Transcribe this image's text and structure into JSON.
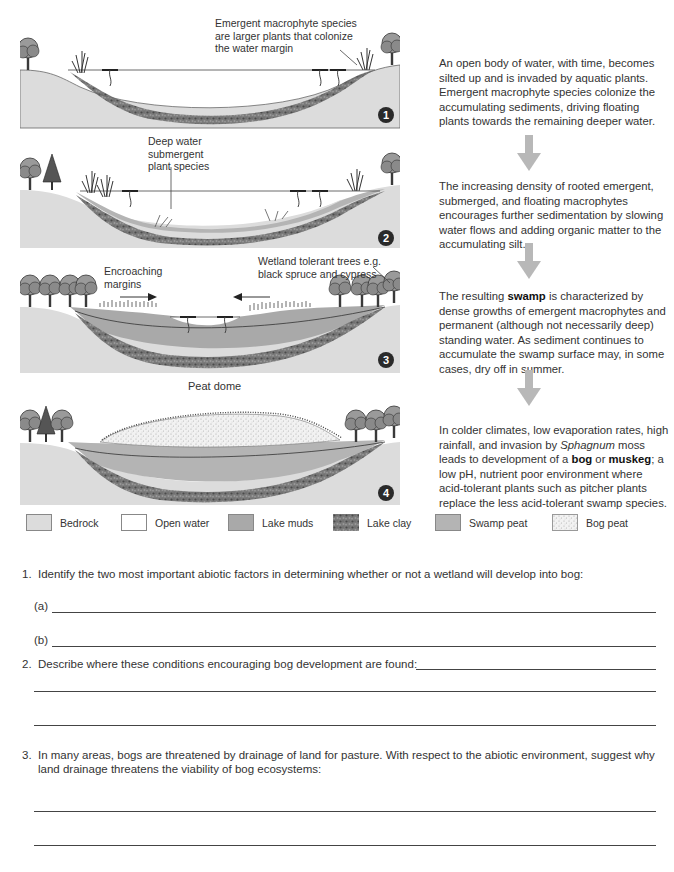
{
  "colors": {
    "bedrock": "#dcdcdc",
    "open_water": "#ffffff",
    "lake_muds": "#a9a9a9",
    "lake_clay": "#6e6e6e",
    "swamp_peat": "#b4b4b4",
    "bog_peat": "#ececec",
    "arrow": "#b8b8b8",
    "badge": "#2a2a2a"
  },
  "panels": [
    {
      "number": "1",
      "callouts": [
        "Emergent macrophyte species are larger plants that colonize the water margin"
      ]
    },
    {
      "number": "2",
      "callouts": [
        "Deep water submergent plant species"
      ]
    },
    {
      "number": "3",
      "callouts": [
        "Encroaching margins",
        "Wetland tolerant trees e.g. black spruce and cypress"
      ]
    },
    {
      "number": "4",
      "callouts": [
        "Peat dome"
      ]
    }
  ],
  "descriptions": [
    {
      "parts": [
        {
          "t": "An open body of water, with time, becomes silted up and is invaded by aquatic plants. Emergent macrophyte species colonize the accumulating sediments, driving floating plants towards the remaining deeper water."
        }
      ]
    },
    {
      "parts": [
        {
          "t": "The increasing density of rooted emergent, submerged, and floating macrophytes encourages further sedimentation by slowing water flows and adding organic matter to the accumulating silt."
        }
      ]
    },
    {
      "p1": "The resulting ",
      "b1": "swamp",
      "p2": " is characterized by dense growths of emergent macrophytes and permanent (although not necessarily deep) standing water. As sediment continues to accumulate the swamp surface may, in some cases, dry off in summer."
    },
    {
      "p1": "In colder climates, low evaporation rates, high rainfall, and invasion by ",
      "i1": "Sphagnum",
      "p2": " moss leads to development of a ",
      "b1": "bog",
      "p3": " or ",
      "b2": "muskeg",
      "p4": "; a low pH, nutrient poor environment where acid-tolerant plants such as pitcher plants replace the less acid-tolerant swamp species."
    }
  ],
  "legend": [
    {
      "label": "Bedrock",
      "icon": "bedrock-swatch"
    },
    {
      "label": "Open water",
      "icon": "open-water-swatch"
    },
    {
      "label": "Lake muds",
      "icon": "lake-muds-swatch"
    },
    {
      "label": "Lake clay",
      "icon": "lake-clay-swatch"
    },
    {
      "label": "Swamp peat",
      "icon": "swamp-peat-swatch"
    },
    {
      "label": "Bog peat",
      "icon": "bog-peat-swatch"
    }
  ],
  "questions": [
    {
      "number": "1.",
      "text": "Identify the two most important abiotic factors in determining whether or not a wetland will develop into bog:",
      "sub": [
        "(a)",
        "(b)"
      ]
    },
    {
      "number": "2.",
      "text": "Describe where these conditions encouraging bog development are found:"
    },
    {
      "number": "3.",
      "text": "In many areas, bogs are threatened by drainage of land for pasture. With respect to the abiotic environment, suggest why land drainage threatens the viability of bog ecosystems:"
    }
  ]
}
